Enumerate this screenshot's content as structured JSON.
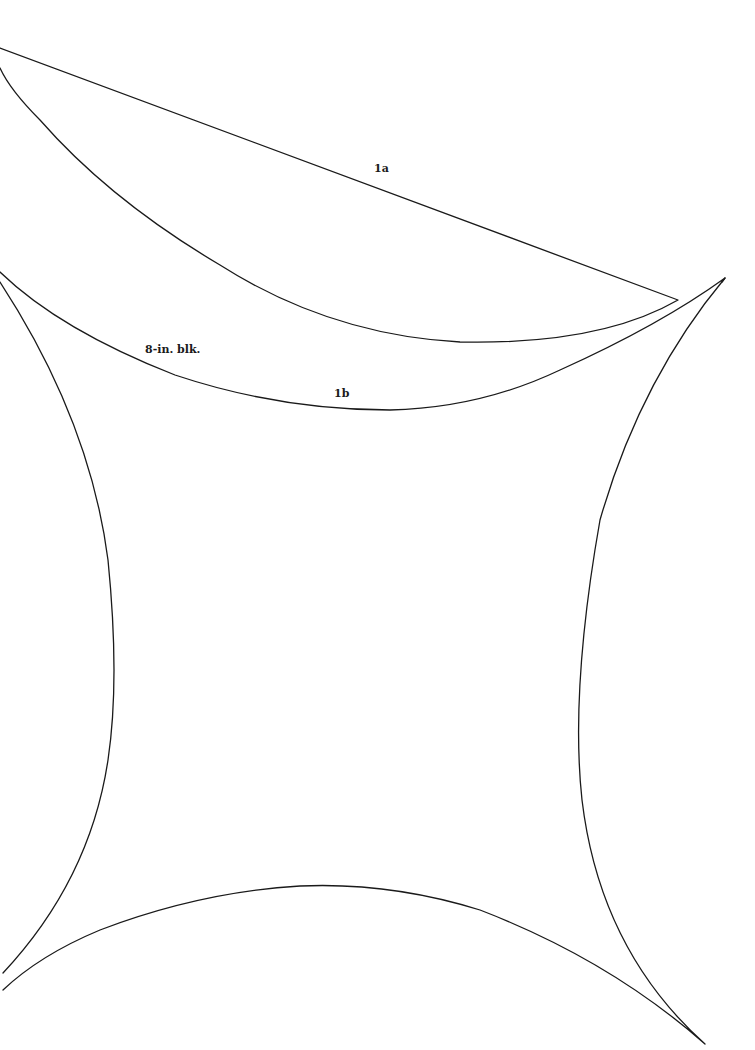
{
  "page": {
    "background": "#ffffff",
    "stroke_color": "#1a1a1a"
  },
  "pieces": [
    {
      "id": "1a",
      "label": "1a",
      "description": "curved wedge template piece"
    },
    {
      "id": "1b",
      "label": "1b",
      "description": "concave-sided block template piece"
    }
  ],
  "labels": {
    "piece_1a": "1a",
    "block_size": "8-in. blk.",
    "piece_1b": "1b"
  }
}
